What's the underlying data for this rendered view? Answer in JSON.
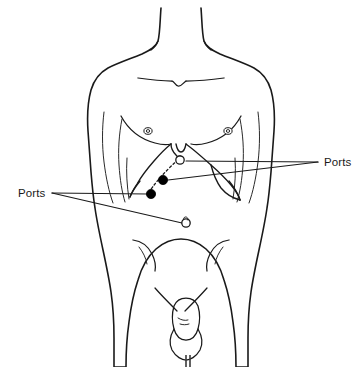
{
  "figure": {
    "background_color": "#ffffff",
    "line_color": "#1a1a1a",
    "width": 362,
    "height": 367
  },
  "annotations": [
    {
      "id": "ports-left",
      "label": "Ports",
      "text_x": 18,
      "text_y": 197,
      "side": "left",
      "leaders": [
        {
          "x1": 52,
          "y1": 193,
          "x2": 148,
          "y2": 194
        },
        {
          "x1": 52,
          "y1": 193,
          "x2": 182,
          "y2": 223
        }
      ]
    },
    {
      "id": "ports-right",
      "label": "Ports",
      "text_x": 324,
      "text_y": 166,
      "side": "right",
      "leaders": [
        {
          "x1": 318,
          "y1": 162,
          "x2": 186,
          "y2": 161
        },
        {
          "x1": 318,
          "y1": 162,
          "x2": 168,
          "y2": 180
        }
      ]
    }
  ],
  "ports": [
    {
      "id": "port-xiphoid",
      "type": "open",
      "x": 180,
      "y": 160,
      "r": 4.2,
      "label": "xiphoid port"
    },
    {
      "id": "port-upper-dot",
      "type": "filled",
      "x": 163,
      "y": 180,
      "r": 4.6,
      "label": "right subcostal port"
    },
    {
      "id": "port-lower-dot",
      "type": "filled",
      "x": 151,
      "y": 194,
      "r": 4.6,
      "label": "left subcostal port"
    },
    {
      "id": "port-umbilical",
      "type": "open",
      "x": 186,
      "y": 223,
      "r": 4.2,
      "label": "umbilical port"
    }
  ],
  "landmarks": {
    "nipple_left": {
      "x": 148,
      "y": 131
    },
    "nipple_right": {
      "x": 228,
      "y": 131
    },
    "umbilicus": {
      "x": 186,
      "y": 223
    }
  }
}
